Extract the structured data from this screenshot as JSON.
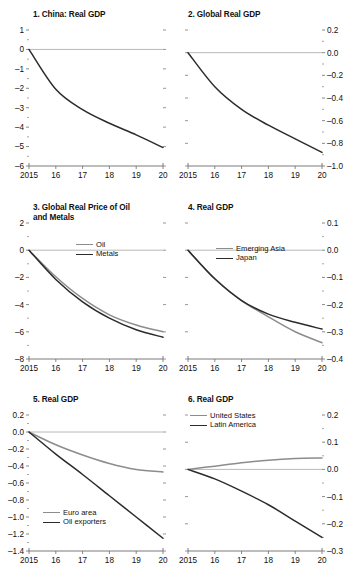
{
  "figure": {
    "background": "#ffffff",
    "series_colors": {
      "gray": "#8c8c8c",
      "black": "#2b2b2b"
    },
    "zero_line_color": "#b0b0b0",
    "axis_color": "#6b6b6b"
  },
  "chart_data": [
    {
      "type": "line",
      "panel": "1",
      "title": "1. China: Real GDP",
      "title_position": "left",
      "yaxis_side": "left",
      "x": [
        "2015",
        "16",
        "17",
        "18",
        "19",
        "20"
      ],
      "xlabel": "",
      "ylabel": "",
      "ylim": [
        -6,
        1
      ],
      "yticks": [
        "1",
        "0",
        "-1",
        "-2",
        "-3",
        "-4",
        "-5",
        "-6"
      ],
      "ytick_values": [
        1,
        0,
        -1,
        -2,
        -3,
        -4,
        -5,
        -6
      ],
      "grid": false,
      "legend": null,
      "series": [
        {
          "name": "China: Real GDP",
          "color": "black",
          "values": [
            0,
            -2.05,
            -3.1,
            -3.8,
            -4.4,
            -5.05
          ]
        }
      ]
    },
    {
      "type": "line",
      "panel": "2",
      "title": "2. Global Real GDP",
      "title_position": "left",
      "yaxis_side": "right",
      "x": [
        "2015",
        "16",
        "17",
        "18",
        "19",
        "20"
      ],
      "xlabel": "",
      "ylabel": "",
      "ylim": [
        -1.0,
        0.2
      ],
      "yticks": [
        "0.2",
        "0.0",
        "-0.2",
        "-0.4",
        "-0.6",
        "-0.8",
        "-1.0"
      ],
      "ytick_values": [
        0.2,
        0.0,
        -0.2,
        -0.4,
        -0.6,
        -0.8,
        -1.0
      ],
      "grid": false,
      "legend": null,
      "series": [
        {
          "name": "Global Real GDP",
          "color": "black",
          "values": [
            0,
            -0.3,
            -0.5,
            -0.64,
            -0.76,
            -0.88
          ]
        }
      ]
    },
    {
      "type": "line",
      "panel": "3",
      "title": "3. Global Real Price of Oil\n     and Metals",
      "title_position": "left",
      "yaxis_side": "left",
      "x": [
        "2015",
        "16",
        "17",
        "18",
        "19",
        "20"
      ],
      "xlabel": "",
      "ylabel": "",
      "ylim": [
        -8,
        2
      ],
      "yticks": [
        "2",
        "0",
        "-2",
        "-4",
        "-6",
        "-8"
      ],
      "ytick_values": [
        2,
        0,
        -2,
        -4,
        -6,
        -8
      ],
      "grid": false,
      "legend": {
        "position": "upper-right",
        "entries": [
          "Oil",
          "Metals"
        ]
      },
      "series": [
        {
          "name": "Oil",
          "color": "gray",
          "values": [
            0,
            -1.95,
            -3.55,
            -4.75,
            -5.5,
            -6.0
          ]
        },
        {
          "name": "Metals",
          "color": "black",
          "values": [
            0,
            -2.15,
            -3.8,
            -5.0,
            -5.85,
            -6.4
          ]
        }
      ]
    },
    {
      "type": "line",
      "panel": "4",
      "title": "4. Real GDP",
      "title_position": "left",
      "yaxis_side": "right",
      "x": [
        "2015",
        "16",
        "17",
        "18",
        "19",
        "20"
      ],
      "xlabel": "",
      "ylabel": "",
      "ylim": [
        -0.4,
        0.1
      ],
      "yticks": [
        "0.1",
        "0.0",
        "-0.1",
        "-0.2",
        "-0.3",
        "-0.4"
      ],
      "ytick_values": [
        0.1,
        0.0,
        -0.1,
        -0.2,
        -0.3,
        -0.4
      ],
      "grid": false,
      "legend": {
        "position": "upper-center",
        "entries": [
          "Emerging Asia",
          "Japan"
        ]
      },
      "series": [
        {
          "name": "Emerging Asia",
          "color": "gray",
          "values": [
            0,
            -0.105,
            -0.185,
            -0.245,
            -0.3,
            -0.34
          ]
        },
        {
          "name": "Japan",
          "color": "black",
          "values": [
            0,
            -0.105,
            -0.185,
            -0.235,
            -0.265,
            -0.29
          ]
        }
      ]
    },
    {
      "type": "line",
      "panel": "5",
      "title": "5. Real GDP",
      "title_position": "left",
      "yaxis_side": "left",
      "x": [
        "2015",
        "16",
        "17",
        "18",
        "19",
        "20"
      ],
      "xlabel": "",
      "ylabel": "",
      "ylim": [
        -1.4,
        0.2
      ],
      "yticks": [
        "0.2",
        "0.0",
        "-0.2",
        "-0.4",
        "-0.6",
        "-0.8",
        "-1.0",
        "-1.2",
        "-1.4"
      ],
      "ytick_values": [
        0.2,
        0.0,
        -0.2,
        -0.4,
        -0.6,
        -0.8,
        -1.0,
        -1.2,
        -1.4
      ],
      "grid": false,
      "legend": {
        "position": "lower-center",
        "entries": [
          "Euro area",
          "Oil exporters"
        ]
      },
      "series": [
        {
          "name": "Euro area",
          "color": "gray",
          "values": [
            0,
            -0.15,
            -0.27,
            -0.37,
            -0.44,
            -0.47
          ]
        },
        {
          "name": "Oil exporters",
          "color": "black",
          "values": [
            0,
            -0.26,
            -0.5,
            -0.75,
            -1.0,
            -1.25
          ]
        }
      ]
    },
    {
      "type": "line",
      "panel": "6",
      "title": "6. Real GDP",
      "title_position": "left",
      "yaxis_side": "right",
      "x": [
        "2015",
        "16",
        "17",
        "18",
        "19",
        "20"
      ],
      "xlabel": "",
      "ylabel": "",
      "ylim": [
        -0.3,
        0.2
      ],
      "yticks": [
        "0.2",
        "0.1",
        "0.0",
        "-0.1",
        "-0.2",
        "-0.3"
      ],
      "ytick_values": [
        0.2,
        0.1,
        0.0,
        -0.1,
        -0.2,
        -0.3
      ],
      "grid": false,
      "legend": {
        "position": "upper-left",
        "entries": [
          "United States",
          "Latin America"
        ]
      },
      "series": [
        {
          "name": "United States",
          "color": "gray",
          "values": [
            0,
            0.012,
            0.024,
            0.034,
            0.04,
            0.042
          ]
        },
        {
          "name": "Latin America",
          "color": "black",
          "values": [
            0,
            -0.035,
            -0.08,
            -0.13,
            -0.19,
            -0.25
          ]
        }
      ]
    }
  ]
}
